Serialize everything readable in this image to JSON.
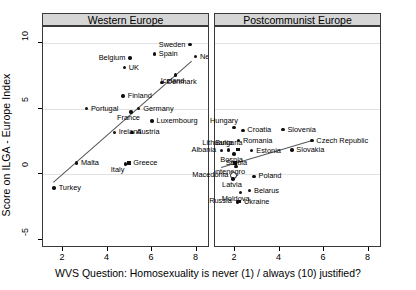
{
  "chart_data": {
    "type": "scatter",
    "title": "",
    "xlabel": "WVS Question: Homosexuality is never (1) / always (10) justified?",
    "ylabel": "Score on ILGA - Europe Index",
    "xlim": [
      1.1,
      8.6
    ],
    "ylim": [
      -5.6,
      11.2
    ],
    "xticks": [
      "2",
      "4",
      "6",
      "8"
    ],
    "yticks": [
      "10",
      "5",
      "0",
      "-5"
    ],
    "grid": "horizontal-gridlines-at-y-0-5-10",
    "legend": "none",
    "panels": [
      {
        "name": "western-europe",
        "label": "Western Europe",
        "fit_line": {
          "x0": 1.55,
          "y0": -0.6,
          "x1": 7.75,
          "y1": 8.6
        },
        "points": [
          {
            "label": "Sweden",
            "x": 7.7,
            "y": 9.85,
            "label_side": "left"
          },
          {
            "label": "Spain",
            "x": 6.1,
            "y": 9.15,
            "label_side": "right"
          },
          {
            "label": "Belgium",
            "x": 5.0,
            "y": 8.85,
            "label_side": "left"
          },
          {
            "label": "UK",
            "x": 4.75,
            "y": 8.1,
            "label_side": "right"
          },
          {
            "label": "Netherlands",
            "x": 7.95,
            "y": 8.95,
            "label_side": "right"
          },
          {
            "label": "Iceland",
            "x": 7.05,
            "y": 7.55,
            "label_side": "below"
          },
          {
            "label": "Denmark",
            "x": 6.45,
            "y": 7.0,
            "label_side": "right"
          },
          {
            "label": "Finland",
            "x": 4.7,
            "y": 5.95,
            "label_side": "right"
          },
          {
            "label": "Germany",
            "x": 5.4,
            "y": 5.0,
            "label_side": "right"
          },
          {
            "label": "Portugal",
            "x": 3.05,
            "y": 5.0,
            "label_side": "right"
          },
          {
            "label": "France",
            "x": 5.05,
            "y": 4.75,
            "label_side": "below"
          },
          {
            "label": "Luxembourg",
            "x": 6.0,
            "y": 4.05,
            "label_side": "right"
          },
          {
            "label": "Austria",
            "x": 5.1,
            "y": 3.2,
            "label_side": "right"
          },
          {
            "label": "Ireland",
            "x": 4.3,
            "y": 3.2,
            "label_side": "right"
          },
          {
            "label": "Malta",
            "x": 2.6,
            "y": 0.85,
            "label_side": "right"
          },
          {
            "label": "Greece",
            "x": 4.95,
            "y": 0.85,
            "label_side": "right",
            "marker": "square"
          },
          {
            "label": "Italy",
            "x": 4.8,
            "y": 0.8,
            "label_side": "belowleft"
          },
          {
            "label": "Turkey",
            "x": 1.6,
            "y": -1.05,
            "label_side": "right"
          }
        ]
      },
      {
        "name": "postcommunist-europe",
        "label": "Postcommunist Europe",
        "fit_line": {
          "x0": 1.35,
          "y0": 0.55,
          "x1": 5.45,
          "y1": 2.6
        },
        "points": [
          {
            "label": "Hungary",
            "x": 1.95,
            "y": 3.55,
            "label_side": "above"
          },
          {
            "label": "Croatia",
            "x": 2.35,
            "y": 3.35,
            "label_side": "right"
          },
          {
            "label": "Slovenia",
            "x": 4.15,
            "y": 3.4,
            "label_side": "right"
          },
          {
            "label": "Romania",
            "x": 2.15,
            "y": 2.55,
            "label_side": "right"
          },
          {
            "label": "Czech Republic",
            "x": 5.45,
            "y": 2.55,
            "label_side": "right"
          },
          {
            "label": "Bulgaria",
            "x": 2.15,
            "y": 1.85,
            "label_side": "above",
            "marker": "square"
          },
          {
            "label": "Lithuania",
            "x": 1.7,
            "y": 1.85,
            "label_side": "above"
          },
          {
            "label": "Estonia",
            "x": 2.75,
            "y": 1.8,
            "label_side": "right"
          },
          {
            "label": "Slovakia",
            "x": 4.55,
            "y": 1.85,
            "label_side": "right"
          },
          {
            "label": "Albania",
            "x": 1.4,
            "y": 1.8,
            "label_side": "left"
          },
          {
            "label": "Bosnia",
            "x": 1.95,
            "y": 1.55,
            "label_side": "below"
          },
          {
            "label": "Serbia",
            "x": 2.0,
            "y": 0.85,
            "label_side": "overlap",
            "marker": "square"
          },
          {
            "label": "Montenegro",
            "x": 2.05,
            "y": 0.6,
            "label_side": "below"
          },
          {
            "label": "Macedonia",
            "x": 1.95,
            "y": -0.15,
            "label_side": "left",
            "marker": "circled"
          },
          {
            "label": "Latvia",
            "x": 1.9,
            "y": -0.35,
            "label_side": "below"
          },
          {
            "label": "Poland",
            "x": 2.85,
            "y": -0.15,
            "label_side": "right"
          },
          {
            "label": "Belarus",
            "x": 2.65,
            "y": -1.25,
            "label_side": "right"
          },
          {
            "label": "Moldova",
            "x": 2.25,
            "y": -1.4,
            "label_side": "below"
          },
          {
            "label": "Ukraine",
            "x": 2.2,
            "y": -2.1,
            "label_side": "right",
            "marker": "square"
          },
          {
            "label": "Russia",
            "x": 2.1,
            "y": -2.1,
            "label_side": "left"
          }
        ]
      }
    ]
  }
}
